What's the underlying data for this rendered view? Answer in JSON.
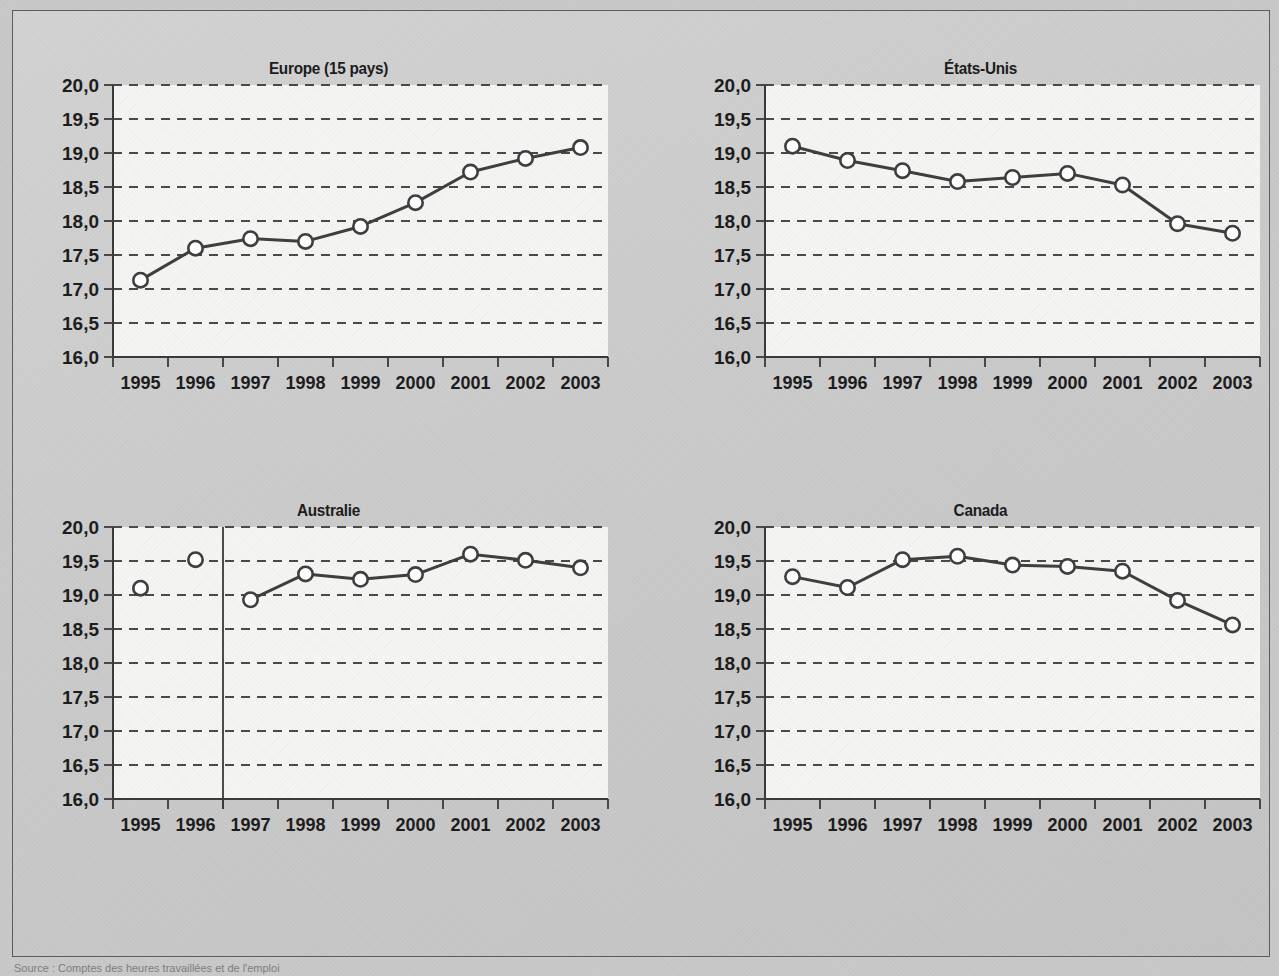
{
  "figure": {
    "source_note": "Source : Comptes des heures travaillées et de l'emploi",
    "axis": {
      "y_ticks": [
        "20,0",
        "19,5",
        "19,0",
        "18,5",
        "18,0",
        "17,5",
        "17,0",
        "16,5",
        "16,0"
      ],
      "y_min": 16.0,
      "y_max": 20.0,
      "x_ticks": [
        "1995",
        "1996",
        "1997",
        "1998",
        "1999",
        "2000",
        "2001",
        "2002",
        "2003"
      ]
    },
    "colors": {
      "page_background": "#c9c9c9",
      "panel_background": "#f5f5f3",
      "frame_border": "#5d5d5d",
      "line": "#3f3f3f",
      "marker_fill": "#ffffff",
      "text": "#1d1d1d"
    }
  },
  "chart_data": [
    {
      "type": "line",
      "title": "Europe (15 pays)",
      "xlabel": "",
      "ylabel": "",
      "ylim": [
        16.0,
        20.0
      ],
      "grid": true,
      "legend": "none",
      "categories": [
        "1995",
        "1996",
        "1997",
        "1998",
        "1999",
        "2000",
        "2001",
        "2002",
        "2003"
      ],
      "values": [
        17.13,
        17.6,
        17.74,
        17.7,
        17.92,
        18.27,
        18.72,
        18.92,
        19.08
      ],
      "break_after_category": null,
      "unconnected_categories": []
    },
    {
      "type": "line",
      "title": "États-Unis",
      "xlabel": "",
      "ylabel": "",
      "ylim": [
        16.0,
        20.0
      ],
      "grid": true,
      "legend": "none",
      "categories": [
        "1995",
        "1996",
        "1997",
        "1998",
        "1999",
        "2000",
        "2001",
        "2002",
        "2003"
      ],
      "values": [
        19.1,
        18.89,
        18.74,
        18.58,
        18.64,
        18.7,
        18.53,
        17.96,
        17.82
      ],
      "break_after_category": null,
      "unconnected_categories": []
    },
    {
      "type": "line",
      "title": "Australie",
      "xlabel": "",
      "ylabel": "",
      "ylim": [
        16.0,
        20.0
      ],
      "grid": true,
      "legend": "none",
      "categories": [
        "1995",
        "1996",
        "1997",
        "1998",
        "1999",
        "2000",
        "2001",
        "2002",
        "2003"
      ],
      "values": [
        19.1,
        19.52,
        18.93,
        19.31,
        19.23,
        19.3,
        19.6,
        19.51,
        19.4
      ],
      "break_after_category": "1996",
      "unconnected_categories": [
        "1995",
        "1996"
      ]
    },
    {
      "type": "line",
      "title": "Canada",
      "xlabel": "",
      "ylabel": "",
      "ylim": [
        16.0,
        20.0
      ],
      "grid": true,
      "legend": "none",
      "categories": [
        "1995",
        "1996",
        "1997",
        "1998",
        "1999",
        "2000",
        "2001",
        "2002",
        "2003"
      ],
      "values": [
        19.27,
        19.11,
        19.52,
        19.57,
        19.44,
        19.42,
        19.35,
        18.92,
        18.56
      ],
      "break_after_category": null,
      "unconnected_categories": []
    }
  ]
}
